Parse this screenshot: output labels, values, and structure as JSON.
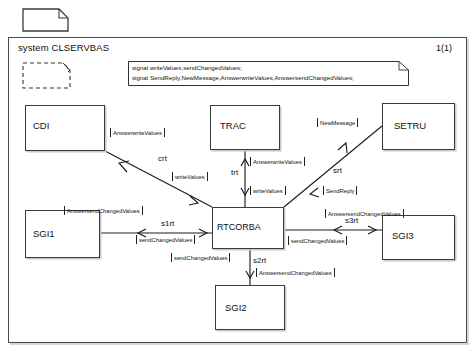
{
  "document": {
    "page_icon": "page-document-icon",
    "page_number": "1(1)"
  },
  "system": {
    "title": "system CLSERVBAS",
    "frame_color": "#4a4a4a"
  },
  "declarations": {
    "line1": "signal writeValues,sendChangedValues;",
    "line2": "signal SendReply,NewMessage,AnswerwriteValues,AnswersendChangedValues;"
  },
  "blocks": [
    {
      "id": "cdi",
      "label": "CDI"
    },
    {
      "id": "trac",
      "label": "TRAC"
    },
    {
      "id": "setru",
      "label": "SETRU"
    },
    {
      "id": "rtcorba",
      "label": "RTCORBA"
    },
    {
      "id": "sgi1",
      "label": "SGI1"
    },
    {
      "id": "sgi2",
      "label": "SGI2"
    },
    {
      "id": "sgi3",
      "label": "SGI3"
    }
  ],
  "channels": [
    {
      "name": "crt",
      "from": "CDI",
      "to": "RTCORBA",
      "signals_out": "[AnswerwriteValues]",
      "signals_in": "[writeValues]"
    },
    {
      "name": "trt",
      "from": "TRAC",
      "to": "RTCORBA",
      "signals_out": "[AnswerwriteValues]",
      "signals_in": "[writeValues]"
    },
    {
      "name": "srt",
      "from": "RTCORBA",
      "to": "SETRU",
      "signals_out": "[NewMessage]",
      "signals_in": "[SendReply]"
    },
    {
      "name": "s1rt",
      "from": "SGI1",
      "to": "RTCORBA",
      "signals_out": "[AnswersendChangedValues]",
      "signals_in": "[sendChangedValues]"
    },
    {
      "name": "s2rt",
      "from": "RTCORBA",
      "to": "SGI2",
      "signals_out": "[sendChangedValues]",
      "signals_in": "[AnswersendChangedValues]"
    },
    {
      "name": "s3rt",
      "from": "RTCORBA",
      "to": "SGI3",
      "signals_out": "[AnswersendChangedValues]",
      "signals_in": "[sendChangedValues]"
    }
  ],
  "labels": {
    "crt_answerwritevalues": "AnswerwriteValues",
    "crt_writevalues": "writeValues",
    "crt_name": "crt",
    "trt_answerwritevalues": "AnswerwriteValues",
    "trt_writevalues": "writeValues",
    "trt_name": "trt",
    "srt_newmessage": "NewMessage",
    "srt_sendreply": "SendReply",
    "srt_name": "srt",
    "s1rt_answersend": "AnswersendChangedValues",
    "s1rt_send": "sendChangedValues",
    "s1rt_name": "s1rt",
    "s2rt_send": "sendChangedValues",
    "s2rt_answersend": "AnswersendChangedValues",
    "s2rt_name": "s2rt",
    "s3rt_answersend": "AnswersendChangedValues",
    "s3rt_send": "sendChangedValues",
    "s3rt_name": "s3rt"
  }
}
